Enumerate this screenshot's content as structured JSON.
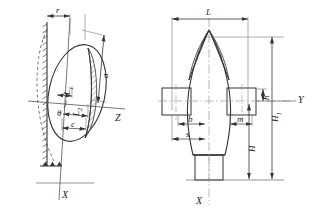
{
  "figure": {
    "title": "",
    "type": "engineering-dimension-drawing",
    "views": [
      {
        "name": "left-view",
        "description": "Inclined ellipsoidal body resting against hatched vertical wall",
        "axes": [
          {
            "name": "Z",
            "label": "Z",
            "orientation": "horizontal"
          },
          {
            "name": "X",
            "label": "X",
            "orientation": "vertical"
          }
        ],
        "dimensions": [
          {
            "name": "r",
            "label": "r",
            "placement": "top-horizontal"
          },
          {
            "name": "a",
            "label": "a",
            "placement": "right-inclined"
          },
          {
            "name": "L1",
            "label": "L",
            "sub": "1",
            "placement": "mid-left-horizontal"
          },
          {
            "name": "L2",
            "label": "L",
            "sub": "2",
            "placement": "mid-horizontal"
          },
          {
            "name": "c",
            "label": "c",
            "placement": "lower-horizontal"
          },
          {
            "name": "theta",
            "label": "θ",
            "placement": "angle-at-axis"
          }
        ]
      },
      {
        "name": "right-view",
        "description": "Front elevation of ogive body with side lugs and bottom stem",
        "axes": [
          {
            "name": "Y",
            "label": "Y",
            "orientation": "horizontal"
          },
          {
            "name": "X",
            "label": "X",
            "orientation": "vertical"
          }
        ],
        "dimensions": [
          {
            "name": "L",
            "label": "L",
            "placement": "top-horizontal"
          },
          {
            "name": "b",
            "label": "b",
            "placement": "mid-left-horizontal"
          },
          {
            "name": "s",
            "label": "s",
            "placement": "lower-left-horizontal"
          },
          {
            "name": "m",
            "label": "m",
            "placement": "mid-right-horizontal"
          },
          {
            "name": "h",
            "label": "h",
            "placement": "right-vertical-short"
          },
          {
            "name": "H1",
            "label": "H",
            "sub": "1",
            "placement": "right-vertical-mid"
          },
          {
            "name": "H",
            "label": "H",
            "placement": "right-vertical-long"
          }
        ]
      }
    ],
    "colors": {
      "line": "#333333",
      "thin": "#777777",
      "centerline": "#999999",
      "hatch": "#444444",
      "background": "#ffffff"
    }
  }
}
